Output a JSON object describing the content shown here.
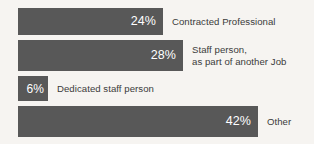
{
  "chart_data": {
    "type": "bar",
    "orientation": "horizontal",
    "title": "",
    "subtitle": "",
    "xlabel": "",
    "ylabel": "",
    "categories": [
      "Contracted Professional",
      "Staff person,\nas part of another Job",
      "Dedicated staff person",
      "Other"
    ],
    "values": [
      24,
      28,
      6,
      42
    ],
    "value_labels": [
      "24%",
      "28%",
      "6%",
      "42%"
    ],
    "value_unit": "%",
    "xlim": [
      0,
      42
    ],
    "grid": false,
    "legend": null,
    "series": [
      {
        "name": "Share of respondents",
        "values": [
          24,
          28,
          6,
          42
        ]
      }
    ]
  },
  "chart": {
    "bars": [
      {
        "value_label": "24%",
        "category_label": "Contracted Professional",
        "value": 24
      },
      {
        "value_label": "28%",
        "category_label": "Staff person,\nas part of another Job",
        "value": 28
      },
      {
        "value_label": "6%",
        "category_label": "Dedicated staff person",
        "value": 6
      },
      {
        "value_label": "42%",
        "category_label": "Other",
        "value": 42
      }
    ]
  },
  "colors": {
    "background": "#f6f4f1",
    "bar_fill": "#585858",
    "value_text": "#ffffff",
    "label_text": "#3b3b3b"
  }
}
